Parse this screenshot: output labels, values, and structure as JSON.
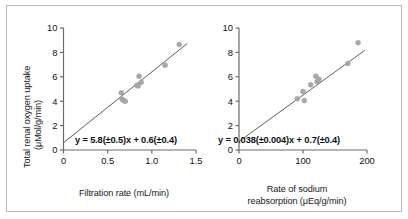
{
  "figure": {
    "background_color": "#ffffff",
    "frame_color": "#b9b9b9",
    "marker_color": "#a8a8a8",
    "line_color": "#4d4d4d",
    "axis_color": "#6b6b6b"
  },
  "chart_data": [
    {
      "type": "scatter",
      "panel": "left",
      "title": "",
      "xlabel": "Filtration rate (mL/min)",
      "ylabel": "Total renal oxygen uptake (μMol/g/min)",
      "ylabel_line1": "Total renal oxygen uptake",
      "ylabel_line2": "(μMol/g/min)",
      "xlim": [
        0,
        1.5
      ],
      "ylim": [
        0,
        10
      ],
      "xticks": [
        0,
        0.5,
        1.0,
        1.5
      ],
      "xticklabels": [
        "0",
        "0.5",
        "1.0",
        "1.5"
      ],
      "yticks": [
        0,
        2,
        4,
        6,
        8,
        10
      ],
      "yticklabels": [
        "0",
        "2",
        "4",
        "6",
        "8",
        "10"
      ],
      "grid": false,
      "legend": "none",
      "annotation": "y = 5.8(±0.5)x + 0.6(±0.4)",
      "fit": {
        "slope": 5.8,
        "slope_error": 0.5,
        "intercept": 0.6,
        "intercept_error": 0.4
      },
      "points": [
        {
          "x": 0.655,
          "y": 4.7
        },
        {
          "x": 0.665,
          "y": 4.15
        },
        {
          "x": 0.68,
          "y": 4.05
        },
        {
          "x": 0.7,
          "y": 4.0
        },
        {
          "x": 0.83,
          "y": 5.3
        },
        {
          "x": 0.845,
          "y": 5.25
        },
        {
          "x": 0.855,
          "y": 6.05
        },
        {
          "x": 0.88,
          "y": 5.55
        },
        {
          "x": 1.15,
          "y": 6.95
        },
        {
          "x": 1.31,
          "y": 8.65
        }
      ]
    },
    {
      "type": "scatter",
      "panel": "right",
      "title": "",
      "xlabel": "Rate of sodium reabsorption (μEq/g/min)",
      "xlabel_line1": "Rate of sodium",
      "xlabel_line2": "reabsorption (μEq/g/min)",
      "ylabel": "",
      "xlim": [
        0,
        200
      ],
      "ylim": [
        0,
        10
      ],
      "xticks": [
        0,
        100,
        200
      ],
      "xticklabels": [
        "0",
        "100",
        "200"
      ],
      "yticks": [
        0,
        2,
        4,
        6,
        8,
        10
      ],
      "yticklabels": [
        "0",
        "2",
        "4",
        "6",
        "8",
        "10"
      ],
      "grid": false,
      "legend": "none",
      "annotation": "y = 0.038(±0.004)x + 0.7(±0.4)",
      "fit": {
        "slope": 0.038,
        "slope_error": 0.004,
        "intercept": 0.7,
        "intercept_error": 0.4
      },
      "points": [
        {
          "x": 91,
          "y": 4.2
        },
        {
          "x": 100,
          "y": 4.8
        },
        {
          "x": 102,
          "y": 4.05
        },
        {
          "x": 112,
          "y": 5.35
        },
        {
          "x": 120,
          "y": 6.05
        },
        {
          "x": 122,
          "y": 5.6
        },
        {
          "x": 125,
          "y": 5.8
        },
        {
          "x": 170,
          "y": 7.1
        },
        {
          "x": 186,
          "y": 8.8
        }
      ]
    }
  ]
}
